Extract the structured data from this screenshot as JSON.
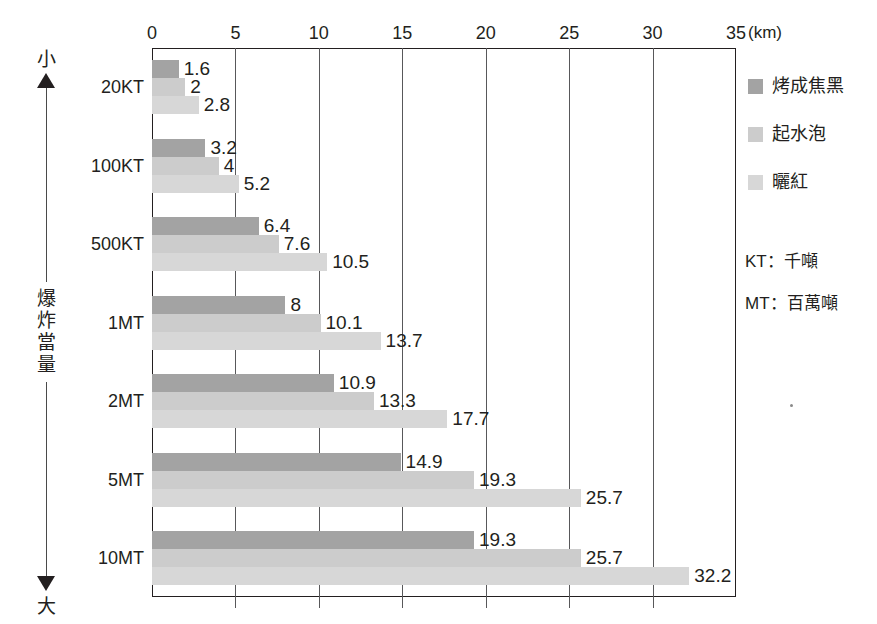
{
  "top_caption": "▔▔▔▔▔▔▔▔▔▔▔▔▔▔▔▔▔▔▔▔▔▔▔▔▔▔▔▔▔▔▔▔▔▔▔▔▔▔▔▔▔▔▔▔▔▔",
  "yaxis": {
    "cap_top": "小",
    "cap_bottom": "大",
    "title": "爆炸當量"
  },
  "legend": {
    "items": [
      {
        "label": "烤成焦黑",
        "color": "#a3a3a3"
      },
      {
        "label": "起水泡",
        "color": "#cccccc"
      },
      {
        "label": "曬紅",
        "color": "#d7d7d7"
      }
    ]
  },
  "notes": [
    "KT：千噸",
    "MT：百萬噸"
  ],
  "chart_data": {
    "type": "bar",
    "orientation": "horizontal",
    "title": "",
    "xlabel": "",
    "xunit": "(km)",
    "ylabel": "爆炸當量",
    "xlim": [
      0,
      35
    ],
    "xticks": [
      0,
      5,
      10,
      15,
      20,
      25,
      30,
      35
    ],
    "xtick_labels": [
      "0",
      "5",
      "10",
      "15",
      "20",
      "25",
      "30",
      "35"
    ],
    "grid": true,
    "legend_position": "right",
    "categories": [
      "20KT",
      "100KT",
      "500KT",
      "1MT",
      "2MT",
      "5MT",
      "10MT"
    ],
    "series": [
      {
        "name": "烤成焦黑",
        "color": "#a3a3a3",
        "values": [
          1.6,
          3.2,
          6.4,
          8,
          10.9,
          14.9,
          19.3
        ],
        "labels": [
          "1.6",
          "3.2",
          "6.4",
          "8",
          "10.9",
          "14.9",
          "19.3"
        ]
      },
      {
        "name": "起水泡",
        "color": "#cccccc",
        "values": [
          2,
          4,
          7.6,
          10.1,
          13.3,
          19.3,
          25.7
        ],
        "labels": [
          "2",
          "4",
          "7.6",
          "10.1",
          "13.3",
          "19.3",
          "25.7"
        ]
      },
      {
        "name": "曬紅",
        "color": "#d7d7d7",
        "values": [
          2.8,
          5.2,
          10.5,
          13.7,
          17.7,
          25.7,
          32.2
        ],
        "labels": [
          "2.8",
          "5.2",
          "10.5",
          "13.7",
          "17.7",
          "25.7",
          "32.2"
        ]
      }
    ]
  }
}
